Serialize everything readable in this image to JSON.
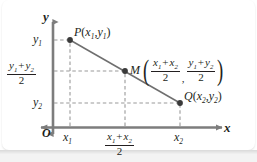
{
  "figure": {
    "type": "coordinate-geometry-diagram",
    "axes": {
      "x_axis_label": "x",
      "y_axis_label": "y",
      "origin_label": "O"
    },
    "points": [
      {
        "name": "P",
        "label": "P",
        "coords": "(x1, y1)",
        "x_px": 70,
        "y_px": 40
      },
      {
        "name": "M",
        "label": "M",
        "coords": "midpoint",
        "x_px": 125,
        "y_px": 71
      },
      {
        "name": "Q",
        "label": "Q",
        "coords": "(x2, y2)",
        "x_px": 180,
        "y_px": 103
      }
    ],
    "labels": {
      "p_point": "P",
      "p_open": "(",
      "p_x": "x",
      "p_xsub": "1",
      "p_comma": ",",
      "p_y": "y",
      "p_ysub": "1",
      "p_close": ")",
      "q_point": "Q",
      "q_open": "(",
      "q_x": "x",
      "q_xsub": "2",
      "q_comma": ",",
      "q_y": "y",
      "q_ysub": "2",
      "q_close": ")",
      "m_point": "M",
      "m_paren_open": "(",
      "m_paren_close": ")",
      "m_comma": ",",
      "m_frac1_num_x1": "x",
      "m_frac1_num_x1sub": "1",
      "m_frac1_num_plus": "+",
      "m_frac1_num_x2": "x",
      "m_frac1_num_x2sub": "2",
      "m_frac1_den": "2",
      "m_frac2_num_y1": "y",
      "m_frac2_num_y1sub": "1",
      "m_frac2_num_plus": "+",
      "m_frac2_num_y2": "y",
      "m_frac2_num_y2sub": "2",
      "m_frac2_den": "2"
    },
    "y_ticks": [
      {
        "id": "y1",
        "base": "y",
        "sub": "1",
        "y_px": 40
      },
      {
        "id": "y-mid",
        "kind": "fraction",
        "num_a": "y",
        "num_a_sub": "1",
        "plus": "+",
        "num_b": "y",
        "num_b_sub": "2",
        "den": "2",
        "y_px": 71
      },
      {
        "id": "y2",
        "base": "y",
        "sub": "2",
        "y_px": 103
      }
    ],
    "x_ticks": [
      {
        "id": "x1",
        "base": "x",
        "sub": "1",
        "x_px": 70
      },
      {
        "id": "x-mid",
        "kind": "fraction",
        "num_a": "x",
        "num_a_sub": "1",
        "plus": "+",
        "num_b": "x",
        "num_b_sub": "2",
        "den": "2",
        "x_px": 125
      },
      {
        "id": "x2",
        "base": "x",
        "sub": "2",
        "x_px": 180
      }
    ],
    "colors": {
      "ink": "#231f20",
      "axis": "#7d7d7d",
      "segment": "#6f6f6f",
      "dashed": "#9a9a9a",
      "card_bg": "#ffffff",
      "band_bg": "#f3f3f3"
    }
  }
}
